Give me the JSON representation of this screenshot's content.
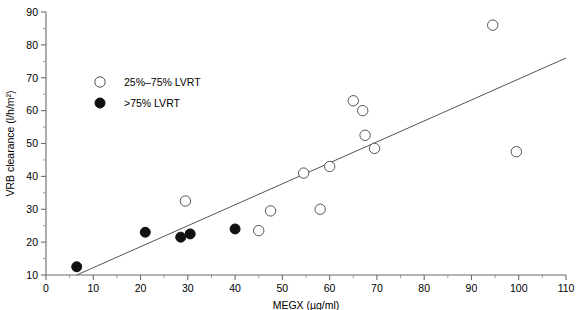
{
  "chart_data": {
    "type": "scatter",
    "title": "",
    "xlabel": "MEGX (µg/ml)",
    "ylabel": "VRB clearance (l/h/m²)",
    "xlim": [
      0,
      110
    ],
    "ylim": [
      10,
      90
    ],
    "xticks": [
      0,
      10,
      20,
      30,
      40,
      50,
      60,
      70,
      80,
      90,
      100,
      110
    ],
    "xticklabels": [
      "0",
      "10",
      "20",
      "30",
      "40",
      "50",
      "60",
      "70",
      "80",
      "90",
      "100",
      "110"
    ],
    "yticks": [
      10,
      20,
      30,
      40,
      50,
      60,
      70,
      80,
      90
    ],
    "yticklabels": [
      "10",
      "20",
      "30",
      "40",
      "50",
      "60",
      "70",
      "80",
      "90"
    ],
    "minor_ticks": true,
    "grid": false,
    "legend_position": "upper-left",
    "series": [
      {
        "name": "25%–75% LVRT",
        "marker": "open-circle",
        "color": "#ffffff",
        "edge_color": "#555555",
        "points": [
          {
            "x": 29.5,
            "y": 32.5
          },
          {
            "x": 45.0,
            "y": 23.5
          },
          {
            "x": 47.5,
            "y": 29.5
          },
          {
            "x": 54.5,
            "y": 41.0
          },
          {
            "x": 58.0,
            "y": 30.0
          },
          {
            "x": 60.0,
            "y": 43.0
          },
          {
            "x": 65.0,
            "y": 63.0
          },
          {
            "x": 67.0,
            "y": 60.0
          },
          {
            "x": 67.5,
            "y": 52.5
          },
          {
            "x": 69.5,
            "y": 48.5
          },
          {
            "x": 94.5,
            "y": 86.0
          },
          {
            "x": 99.5,
            "y": 47.5
          }
        ]
      },
      {
        "name": ">75% LVRT",
        "marker": "filled-circle",
        "color": "#111111",
        "edge_color": "#111111",
        "points": [
          {
            "x": 6.5,
            "y": 12.5
          },
          {
            "x": 21.0,
            "y": 23.0
          },
          {
            "x": 28.5,
            "y": 21.5
          },
          {
            "x": 30.5,
            "y": 22.5
          },
          {
            "x": 40.0,
            "y": 24.0
          }
        ]
      }
    ],
    "trendline": {
      "name": "regression-line",
      "x_start": 6.5,
      "y_start": 10.0,
      "x_end": 110.0,
      "y_end": 76.0
    }
  },
  "legend": {
    "items": [
      {
        "label": "25%–75% LVRT",
        "marker": "open-circle"
      },
      {
        "label": ">75% LVRT",
        "marker": "filled-circle"
      }
    ]
  }
}
